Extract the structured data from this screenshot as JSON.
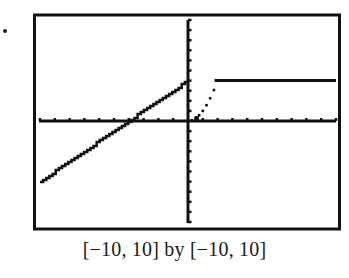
{
  "caption": "[−10, 10] by [−10, 10]",
  "colors": {
    "ink": "#111111",
    "background": "#ffffff"
  },
  "chart_data": {
    "type": "line",
    "title": "",
    "caption": "[−10, 10] by [−10, 10]",
    "xlabel": "",
    "ylabel": "",
    "xlim": [
      -10,
      10
    ],
    "ylim": [
      -10,
      10
    ],
    "x_tick_step": 1,
    "y_tick_step": 1,
    "grid": false,
    "legend": null,
    "series": [
      {
        "name": "piece-1 (y = x + 4, x < 0)",
        "style": "stair-stepped line",
        "x": [
          -10,
          0
        ],
        "y": [
          -6,
          4
        ]
      },
      {
        "name": "piece-2 (y = x^2, 0 <= x <= 2)",
        "style": "dotted",
        "x": [
          0,
          0.5,
          1,
          1.5,
          2
        ],
        "y": [
          0,
          0.25,
          1,
          2.25,
          4
        ]
      },
      {
        "name": "piece-3 (y = 4, x > 2)",
        "style": "solid",
        "x": [
          2,
          10
        ],
        "y": [
          4,
          4
        ]
      }
    ]
  }
}
